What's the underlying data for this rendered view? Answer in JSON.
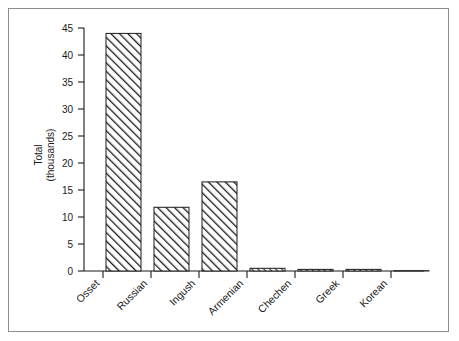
{
  "chart_data": {
    "type": "bar",
    "title": "",
    "subtitle": "",
    "xlabel": "",
    "ylabel": "Total (thousands)",
    "ylabel_lines": [
      "Total",
      "(thousands)"
    ],
    "categories": [
      "Osset",
      "Russian",
      "Ingush",
      "Armenian",
      "Chechen",
      "Greek",
      "Korean"
    ],
    "values": [
      44.0,
      11.8,
      16.5,
      0.5,
      0.3,
      0.3,
      0.05
    ],
    "ylim": [
      0,
      45
    ],
    "yticks": [
      0,
      5,
      10,
      15,
      20,
      25,
      30,
      35,
      40,
      45
    ],
    "ytick_labels": [
      "0",
      "5",
      "10",
      "15",
      "20",
      "25",
      "30",
      "35",
      "40",
      "45"
    ],
    "grid": false,
    "legend": null,
    "legend_position": "none",
    "xtick_label_rotation": 45,
    "bar_fill": "#ffffff",
    "bar_hatch": "/",
    "bar_edge_color": "#1a1a1a",
    "axis_color": "#1a1a1a",
    "frame_color": "#8d8d8d",
    "background": "#ffffff"
  }
}
